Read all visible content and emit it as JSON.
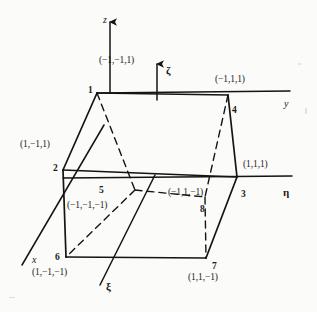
{
  "figure": {
    "background_color": "#fbfbf9",
    "line_color": "#141414",
    "solid_stroke_width": 1.7,
    "dashed_stroke_width": 1.4,
    "axis_stroke_width": 1.5,
    "dash_pattern": "7,5"
  },
  "axes": [
    {
      "id": "axis-z",
      "label": "z",
      "kind": "global",
      "orientation": "vertical-up",
      "from": [
        110,
        93
      ],
      "to": [
        110,
        22
      ],
      "arrow": true,
      "label_pos": [
        103,
        15
      ]
    },
    {
      "id": "axis-y",
      "label": "y",
      "kind": "global",
      "orientation": "horizontal-right",
      "from": [
        97,
        93
      ],
      "to": [
        290,
        91
      ],
      "arrow": false,
      "label_pos": [
        284,
        99
      ]
    },
    {
      "id": "axis-x",
      "label": "x",
      "kind": "global",
      "orientation": "diagonal-down-left",
      "from": [
        104,
        125
      ],
      "to": [
        22,
        265
      ],
      "arrow": false,
      "label_pos": [
        32,
        255
      ]
    },
    {
      "id": "axis-zeta",
      "label": "ζ",
      "kind": "natural",
      "orientation": "vertical-up",
      "from": [
        157,
        100
      ],
      "to": [
        157,
        64
      ],
      "arrow": true,
      "label_pos": [
        166,
        65
      ]
    },
    {
      "id": "axis-eta",
      "label": "η",
      "kind": "natural",
      "orientation": "horizontal-right",
      "from": [
        63,
        178
      ],
      "to": [
        292,
        176
      ],
      "arrow": false,
      "label_pos": [
        283,
        187
      ]
    },
    {
      "id": "axis-xi",
      "label": "ξ",
      "kind": "natural",
      "orientation": "diagonal-down-left",
      "from": [
        155,
        175
      ],
      "to": [
        100,
        285
      ],
      "arrow": false,
      "label_pos": [
        106,
        281
      ]
    }
  ],
  "nodes": [
    {
      "id": 1,
      "number": "1",
      "coord_label": "(−1,−1,1)",
      "pos": [
        97,
        93
      ],
      "num_pos": [
        88,
        86
      ],
      "coord_pos": [
        99,
        56
      ],
      "hidden": false
    },
    {
      "id": 2,
      "number": "2",
      "coord_label": "(1,−1,1)",
      "pos": [
        63,
        170
      ],
      "num_pos": [
        53,
        164
      ],
      "coord_pos": [
        20,
        140
      ],
      "hidden": false
    },
    {
      "id": 3,
      "number": "3",
      "coord_label": "(1,1,1)",
      "pos": [
        237,
        177
      ],
      "num_pos": [
        241,
        190
      ],
      "coord_pos": [
        243,
        160
      ],
      "hidden": false
    },
    {
      "id": 4,
      "number": "4",
      "coord_label": "(−1,1,1)",
      "pos": [
        228,
        95
      ],
      "num_pos": [
        232,
        106
      ],
      "coord_pos": [
        215,
        75
      ],
      "hidden": false
    },
    {
      "id": 5,
      "number": "5",
      "coord_label": "(−1,−1,−1)",
      "pos": [
        135,
        190
      ],
      "num_pos": [
        99,
        186
      ],
      "coord_pos": [
        67,
        201
      ],
      "hidden": true
    },
    {
      "id": 6,
      "number": "6",
      "coord_label": "(1,−1,−1)",
      "pos": [
        66,
        257
      ],
      "num_pos": [
        55,
        253
      ],
      "coord_pos": [
        32,
        268
      ],
      "hidden": false
    },
    {
      "id": 7,
      "number": "7",
      "coord_label": "(1,1,−1)",
      "pos": [
        206,
        258
      ],
      "num_pos": [
        212,
        262
      ],
      "coord_pos": [
        188,
        273
      ],
      "hidden": false
    },
    {
      "id": 8,
      "number": "8",
      "coord_label": "(−1,1,−1)",
      "pos": [
        205,
        197
      ],
      "num_pos": [
        200,
        205
      ],
      "coord_pos": [
        168,
        188
      ],
      "hidden": true
    }
  ],
  "edges": [
    {
      "id": "edge-1-4",
      "from": 1,
      "to": 4,
      "style": "solid",
      "desc": "top back edge"
    },
    {
      "id": "edge-1-2",
      "from": 1,
      "to": 2,
      "style": "solid",
      "desc": "left back vertical edge"
    },
    {
      "id": "edge-2-3",
      "from": 2,
      "to": 3,
      "style": "solid",
      "desc": "front top edge"
    },
    {
      "id": "edge-3-4",
      "from": 3,
      "to": 4,
      "style": "solid",
      "desc": "right back vertical edge"
    },
    {
      "id": "edge-2-6",
      "from": 2,
      "to": 6,
      "style": "solid",
      "desc": "front left vertical edge"
    },
    {
      "id": "edge-6-7",
      "from": 6,
      "to": 7,
      "style": "solid",
      "desc": "front bottom edge"
    },
    {
      "id": "edge-3-7",
      "from": 3,
      "to": 7,
      "style": "solid",
      "desc": "front right vertical edge"
    },
    {
      "id": "edge-1-5",
      "from": 1,
      "to": 5,
      "style": "dashed",
      "desc": "hidden left vertical edge"
    },
    {
      "id": "edge-5-8",
      "from": 5,
      "to": 8,
      "style": "dashed",
      "desc": "hidden bottom back edge"
    },
    {
      "id": "edge-4-8",
      "from": 4,
      "to": 8,
      "style": "dashed",
      "desc": "hidden right vertical edge"
    },
    {
      "id": "edge-5-6",
      "from": 5,
      "to": 6,
      "style": "dashed",
      "desc": "hidden left depth edge"
    },
    {
      "id": "edge-8-7",
      "from": 8,
      "to": 7,
      "style": "dashed",
      "desc": "hidden right depth edge"
    }
  ]
}
